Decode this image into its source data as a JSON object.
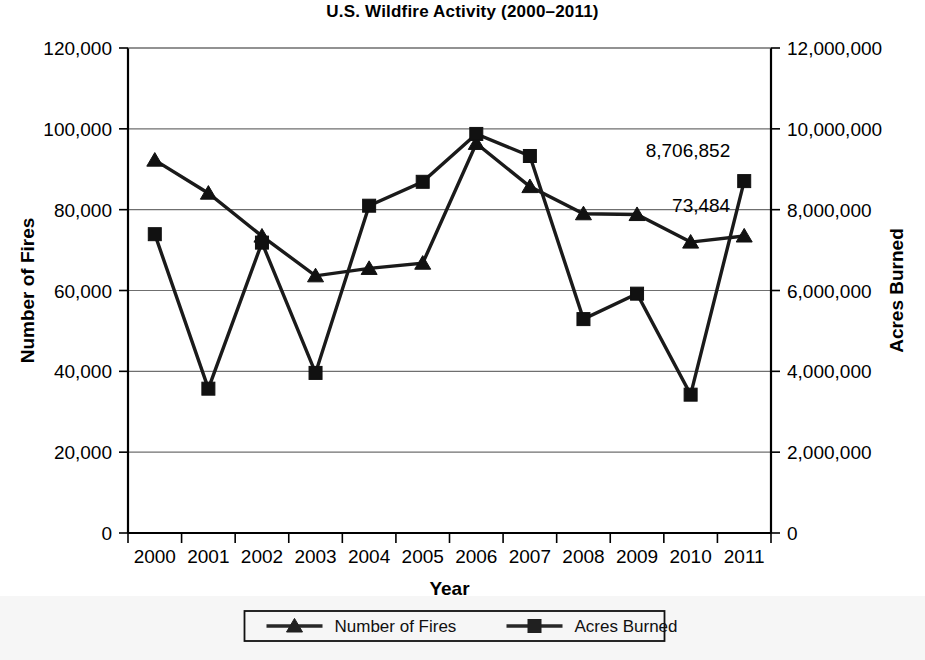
{
  "chart_data": {
    "type": "line",
    "title": "U.S. Wildfire Activity (2000–2011)",
    "xlabel": "Year",
    "ylabel": "Number of Fires",
    "y2label": "Acres Burned",
    "categories": [
      "2000",
      "2001",
      "2002",
      "2003",
      "2004",
      "2005",
      "2006",
      "2007",
      "2008",
      "2009",
      "2010",
      "2011"
    ],
    "ylim": [
      0,
      120000
    ],
    "y2lim": [
      0,
      12000000
    ],
    "yticks": [
      "0",
      "20,000",
      "40,000",
      "60,000",
      "80,000",
      "100,000",
      "120,000"
    ],
    "ytick_values": [
      0,
      20000,
      40000,
      60000,
      80000,
      100000,
      120000
    ],
    "y2ticks": [
      "0",
      "2,000,000",
      "4,000,000",
      "6,000,000",
      "8,000,000",
      "10,000,000",
      "12,000,000"
    ],
    "y2tick_values": [
      0,
      2000000,
      4000000,
      6000000,
      8000000,
      10000000,
      12000000
    ],
    "grid": true,
    "legend_position": "bottom",
    "series": [
      {
        "name": "Number of Fires",
        "axis": "left",
        "marker": "triangle",
        "values": [
          92250,
          84079,
          73457,
          63629,
          65461,
          66753,
          96385,
          85705,
          78979,
          78792,
          71971,
          73484
        ]
      },
      {
        "name": "Acres Burned",
        "axis": "right",
        "marker": "square",
        "values": [
          7393493,
          3570911,
          7184712,
          3960842,
          8097880,
          8689389,
          9873745,
          9328045,
          5292468,
          5921786,
          3422724,
          8706852
        ]
      }
    ],
    "annotations": [
      {
        "text": "8,706,852",
        "series": "Acres Burned",
        "category": "2011"
      },
      {
        "text": "73,484",
        "series": "Number of Fires",
        "category": "2011"
      }
    ]
  }
}
